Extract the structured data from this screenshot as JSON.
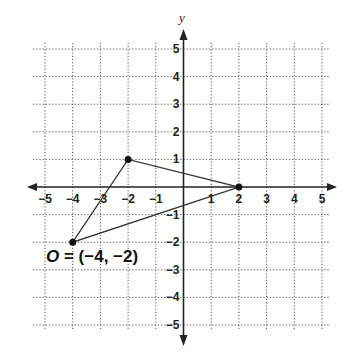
{
  "diagram": {
    "type": "coordinate-plane",
    "x_axis": {
      "label": "",
      "min": -5,
      "max": 5,
      "ticks": [
        "-5",
        "-4",
        "-3",
        "-2",
        "-1",
        "1",
        "2",
        "3",
        "4",
        "5"
      ]
    },
    "y_axis": {
      "label": "y",
      "min": -5,
      "max": 5,
      "ticks": [
        "5",
        "4",
        "3",
        "2",
        "1",
        "-1",
        "-2",
        "-3",
        "-4",
        "-5"
      ]
    },
    "grid": "dotted",
    "triangle": {
      "vertices": [
        {
          "x": -4,
          "y": -2
        },
        {
          "x": -2,
          "y": 1
        },
        {
          "x": 2,
          "y": 0
        }
      ]
    },
    "point_label": {
      "text": "O = (−4, −2)",
      "letter": "O",
      "rest": " = (−4, −2)"
    },
    "colors": {
      "line": "#333333",
      "grid": "#555555",
      "text": "#222222",
      "background": "#ffffff"
    }
  }
}
